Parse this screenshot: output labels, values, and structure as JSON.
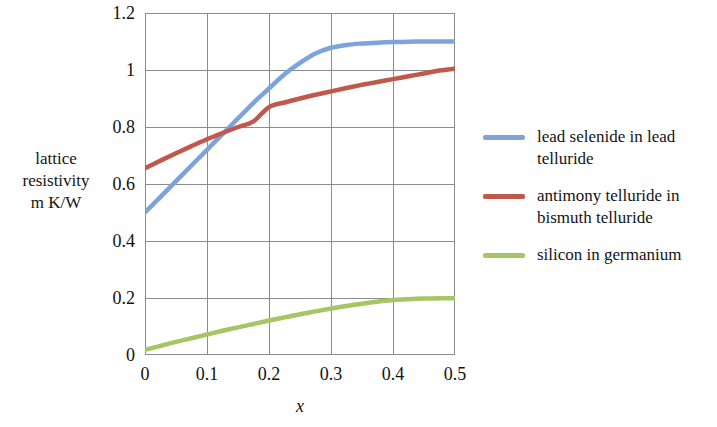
{
  "chart_data": {
    "type": "line",
    "title": "",
    "subtitle": "",
    "xlabel": "x",
    "ylabel": "lattice\nresistivity\nm K/W",
    "xlim": [
      0,
      0.5
    ],
    "ylim": [
      0,
      1.2
    ],
    "xticks": [
      "0",
      "0.1",
      "0.2",
      "0.3",
      "0.4",
      "0.5"
    ],
    "xtick_values": [
      0,
      0.1,
      0.2,
      0.3,
      0.4,
      0.5
    ],
    "yticks": [
      "0",
      "0.2",
      "0.4",
      "0.6",
      "0.8",
      "1",
      "1.2"
    ],
    "ytick_values": [
      0,
      0.2,
      0.4,
      0.6,
      0.8,
      1.0,
      1.2
    ],
    "grid": true,
    "legend_position": "right",
    "series": [
      {
        "name": "lead selenide in lead telluride",
        "color": "#7CA3DC",
        "x": [
          0,
          0.025,
          0.05,
          0.075,
          0.1,
          0.125,
          0.15,
          0.175,
          0.2,
          0.225,
          0.25,
          0.275,
          0.3,
          0.325,
          0.35,
          0.375,
          0.4,
          0.425,
          0.45,
          0.475,
          0.5
        ],
        "values": [
          0.5,
          0.555,
          0.61,
          0.665,
          0.72,
          0.775,
          0.83,
          0.885,
          0.935,
          0.985,
          1.025,
          1.058,
          1.078,
          1.088,
          1.093,
          1.096,
          1.098,
          1.099,
          1.1,
          1.1,
          1.1
        ]
      },
      {
        "name": "antimony telluride in bismuth telluride",
        "color": "#C0584C",
        "x": [
          0,
          0.025,
          0.05,
          0.075,
          0.1,
          0.125,
          0.15,
          0.175,
          0.2,
          0.225,
          0.25,
          0.275,
          0.3,
          0.325,
          0.35,
          0.375,
          0.4,
          0.425,
          0.45,
          0.475,
          0.5
        ],
        "values": [
          0.655,
          0.682,
          0.708,
          0.733,
          0.757,
          0.779,
          0.8,
          0.82,
          0.87,
          0.886,
          0.9,
          0.913,
          0.925,
          0.937,
          0.948,
          0.958,
          0.968,
          0.978,
          0.988,
          0.998,
          1.005
        ]
      },
      {
        "name": "silicon in germanium",
        "color": "#A4C martial",
        "x": [
          0,
          0.025,
          0.05,
          0.075,
          0.1,
          0.125,
          0.15,
          0.175,
          0.2,
          0.225,
          0.25,
          0.275,
          0.3,
          0.325,
          0.35,
          0.375,
          0.4,
          0.425,
          0.45,
          0.475,
          0.5
        ],
        "values": [
          0.018,
          0.032,
          0.046,
          0.059,
          0.072,
          0.085,
          0.097,
          0.109,
          0.121,
          0.132,
          0.143,
          0.153,
          0.163,
          0.172,
          0.18,
          0.187,
          0.193,
          0.196,
          0.198,
          0.199,
          0.199
        ]
      }
    ]
  },
  "legend": {
    "entries": [
      {
        "label": "lead selenide in lead telluride",
        "color": "#7CA3DC"
      },
      {
        "label": "antimony telluride in bismuth telluride",
        "color": "#C0584C"
      },
      {
        "label": "silicon in germanium",
        "color": "#A6C563"
      }
    ]
  },
  "axes": {
    "y_caption": "lattice\nresistivity\nm K/W",
    "x_caption": "x"
  },
  "colors": {
    "series_blue": "#7CA3DC",
    "series_red": "#C0584C",
    "series_green": "#A6C563",
    "grid": "#8c8c8c",
    "axis": "#8c8c8c",
    "text": "#141414",
    "background": "#ffffff"
  }
}
